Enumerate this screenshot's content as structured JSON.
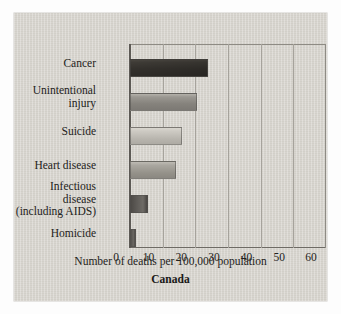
{
  "chart_data": {
    "type": "bar",
    "orientation": "horizontal",
    "title": "",
    "subtitle": "Canada",
    "xlabel": "Number of deaths per 100,000 population",
    "ylabel": "",
    "categories": [
      "Cancer",
      "Unintentional\ninjury",
      "Suicide",
      "Heart disease",
      "Infectious\ndisease\n(including AIDS)",
      "Homicide"
    ],
    "values": [
      24,
      20.5,
      16,
      14,
      5.5,
      1.7
    ],
    "xlim": [
      0,
      60
    ],
    "xticks": [
      0,
      10,
      20,
      30,
      40,
      50,
      60
    ],
    "xtick_labels": [
      "0",
      "10",
      "20",
      "30",
      "40",
      "50",
      "60"
    ],
    "grid": "vertical",
    "legend": "none",
    "bar_tones": [
      "tone-a",
      "tone-b",
      "tone-c",
      "tone-d",
      "tone-e",
      "tone-f"
    ],
    "colors": {
      "panel": "#d6d3cc",
      "axis": "#5d5a55",
      "gridline": "#a6a39c",
      "text": "#232220",
      "bar_dark": "#6a6762",
      "bar_light": "#d9d6cf"
    }
  }
}
